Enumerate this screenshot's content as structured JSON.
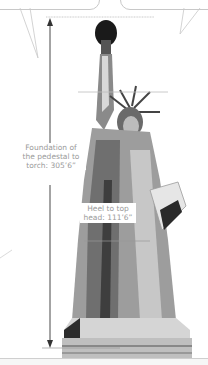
{
  "figure": {
    "measurements": [
      {
        "id": "foundation_to_torch",
        "label_line1": "Foundation of",
        "label_line2": "the pedestal to",
        "label_line3": "torch: 305’6”"
      },
      {
        "id": "heel_to_head",
        "label_line1": "Heel to top",
        "label_line2": "head: 111’6”"
      }
    ]
  },
  "colors": {
    "line": "#bdbdbd",
    "arrow": "#333333",
    "label_text": "#9a9a9a"
  }
}
